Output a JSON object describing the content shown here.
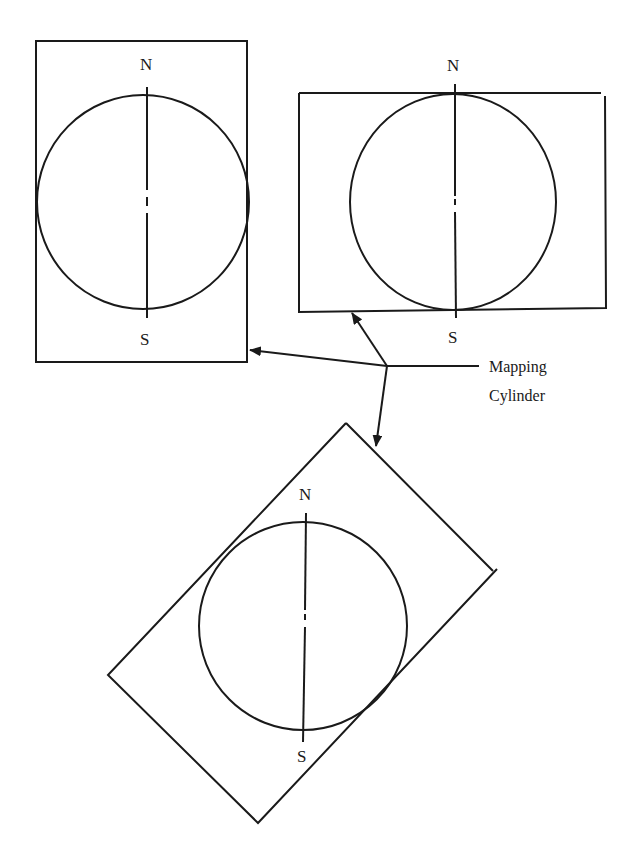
{
  "diagram": {
    "stroke_color": "#1a1a1a",
    "background": "#ffffff",
    "panels": [
      {
        "id": "normal-tall",
        "north_label": "N",
        "south_label": "S"
      },
      {
        "id": "normal-wide",
        "north_label": "N",
        "south_label": "S"
      },
      {
        "id": "oblique",
        "north_label": "N",
        "south_label": "S"
      }
    ],
    "callout": {
      "line1": "Mapping",
      "line2": "Cylinder"
    }
  }
}
